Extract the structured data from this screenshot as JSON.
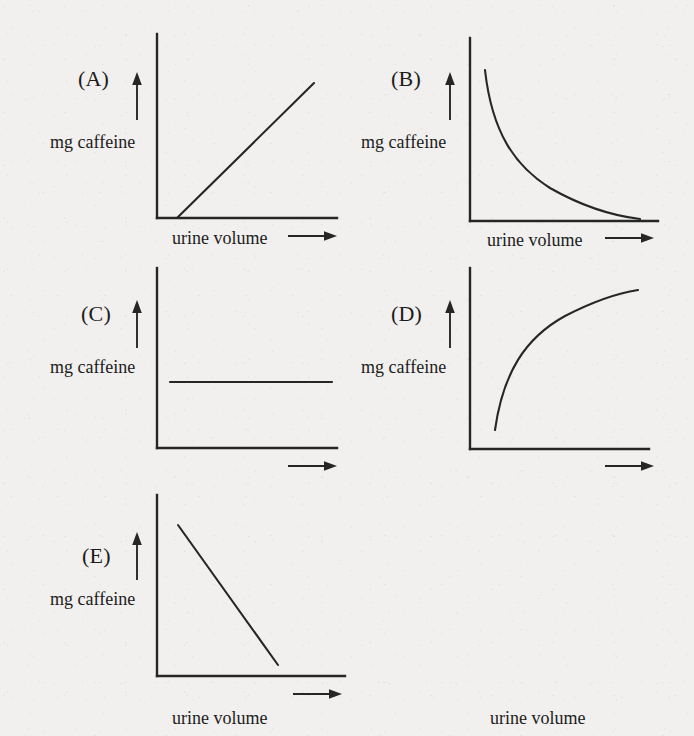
{
  "figure": {
    "background_color": "#f1f0ee",
    "ink_color": "#262626",
    "panel_count": 5
  },
  "labels": {
    "y_axis": "mg caffeine",
    "x_axis": "urine volume",
    "x_axis_arrow_icon": "right-arrow-icon",
    "y_axis_arrow_icon": "up-arrow-icon",
    "panel_a": "(A)",
    "panel_b": "(B)",
    "panel_c": "(C)",
    "panel_d": "(D)",
    "panel_e": "(E)"
  },
  "chart_data": [
    {
      "id": "A",
      "type": "line",
      "title": "(A)",
      "xlabel": "urine volume",
      "ylabel": "mg caffeine",
      "relationship": "linear increasing",
      "grid": false,
      "legend": "none",
      "axis_ticks": "none",
      "xlim": [
        0,
        1
      ],
      "ylim": [
        0,
        1
      ],
      "x": [
        0.11,
        1.0
      ],
      "y": [
        0.08,
        0.82
      ],
      "path": "M 20,184 L 157,49"
    },
    {
      "id": "B",
      "type": "line",
      "title": "(B)",
      "xlabel": "urine volume",
      "ylabel": "mg caffeine",
      "relationship": "inverse decay (hyperbolic decreasing)",
      "grid": false,
      "legend": "none",
      "axis_ticks": "none",
      "xlim": [
        0,
        1
      ],
      "ylim": [
        0,
        1
      ],
      "x": [
        0.08,
        0.2,
        0.35,
        0.5,
        0.7,
        0.9
      ],
      "y": [
        0.83,
        0.5,
        0.3,
        0.2,
        0.12,
        0.09
      ],
      "path": "M 15,32 C 22,95 45,128 80,150 C 115,170 145,178 170,181"
    },
    {
      "id": "C",
      "type": "line",
      "title": "(C)",
      "xlabel": "urine volume",
      "ylabel": "mg caffeine",
      "relationship": "constant (no change)",
      "grid": false,
      "legend": "none",
      "axis_ticks": "none",
      "xlim": [
        0,
        1
      ],
      "ylim": [
        0,
        1
      ],
      "x": [
        0.07,
        0.97
      ],
      "y": [
        0.37,
        0.37
      ],
      "path": "M 13,114 L 175,114"
    },
    {
      "id": "D",
      "type": "line",
      "title": "(D)",
      "xlabel": "urine volume",
      "ylabel": "mg caffeine",
      "relationship": "saturating increase (asymptotic plateau)",
      "grid": false,
      "legend": "none",
      "axis_ticks": "none",
      "xlim": [
        0,
        1
      ],
      "ylim": [
        0,
        1
      ],
      "x": [
        0.13,
        0.25,
        0.42,
        0.6,
        0.8,
        0.93
      ],
      "y": [
        0.11,
        0.45,
        0.65,
        0.76,
        0.84,
        0.88
      ],
      "path": "M 25,162 C 33,105 55,70 95,48 C 130,30 155,24 168,22"
    },
    {
      "id": "E",
      "type": "line",
      "title": "(E)",
      "xlabel": "urine volume",
      "ylabel": "mg caffeine",
      "relationship": "linear decreasing",
      "grid": false,
      "legend": "none",
      "axis_ticks": "none",
      "xlim": [
        0,
        1
      ],
      "ylim": [
        0,
        1
      ],
      "x": [
        0.11,
        0.64
      ],
      "y": [
        0.83,
        0.02
      ],
      "path": "M 21,30 L 121,170"
    }
  ]
}
